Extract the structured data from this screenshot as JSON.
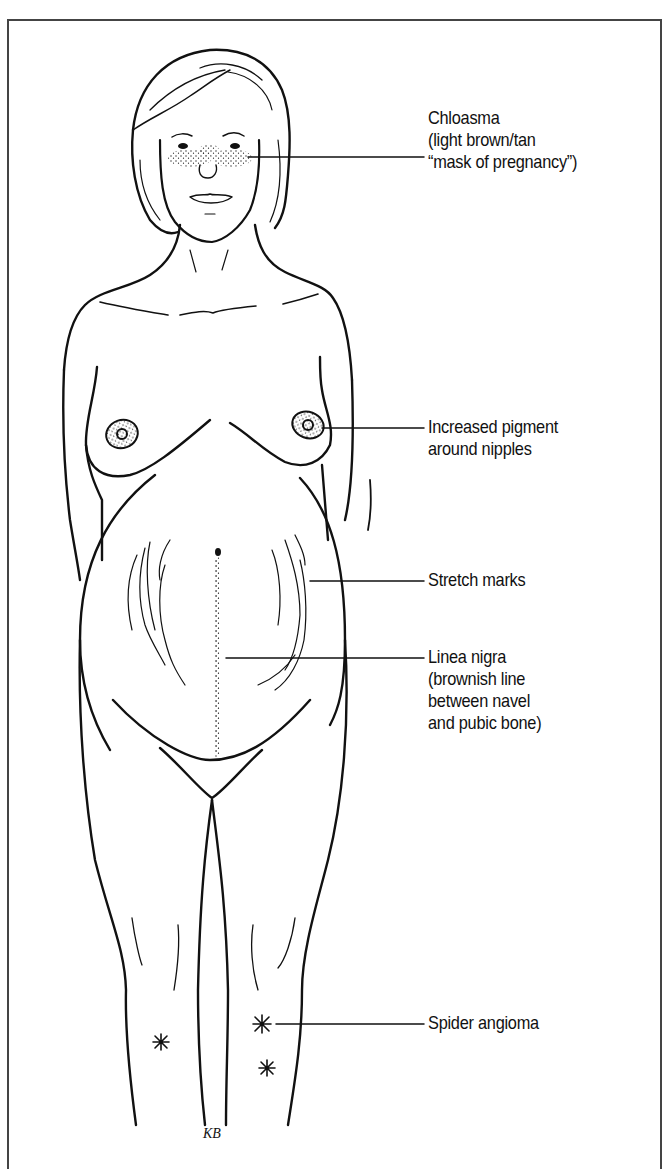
{
  "figure": {
    "artist_initials": "KB",
    "line_color": "#111111",
    "frame_color": "#444444",
    "background": "#ffffff"
  },
  "annotations": [
    {
      "id": "chloasma",
      "lines": [
        "Chloasma",
        "(light brown/tan",
        "“mask of pregnancy”)"
      ]
    },
    {
      "id": "nipple-pigment",
      "lines": [
        "Increased pigment",
        "around nipples"
      ]
    },
    {
      "id": "stretch-marks",
      "lines": [
        "Stretch marks"
      ]
    },
    {
      "id": "linea-nigra",
      "lines": [
        "Linea nigra",
        "(brownish line",
        "between navel",
        "and pubic bone)"
      ]
    },
    {
      "id": "spider-angioma",
      "lines": [
        "Spider angioma"
      ]
    }
  ]
}
